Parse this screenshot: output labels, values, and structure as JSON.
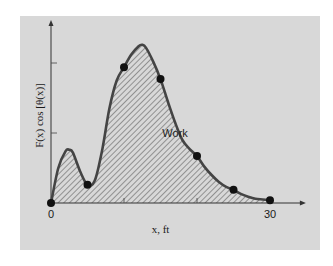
{
  "chart_data": {
    "type": "area",
    "title": "",
    "xlabel": "x, ft",
    "ylabel": "F(x) cos [θ(x)]",
    "xlim": [
      0,
      33
    ],
    "ylim": [
      0,
      2.6
    ],
    "x_ticks": [
      0,
      10,
      20,
      30
    ],
    "x_tick_labels": [
      "0",
      "",
      "",
      "30"
    ],
    "y_ticks": [
      1,
      2
    ],
    "y_tick_labels": [
      "",
      ""
    ],
    "grid": false,
    "area_label": "Work",
    "points": {
      "x": [
        0,
        5,
        10,
        15,
        20,
        25,
        30
      ],
      "y": [
        0.0,
        0.26,
        1.94,
        1.77,
        0.67,
        0.19,
        0.04
      ]
    },
    "curve": {
      "x": [
        0,
        1,
        2,
        2.5,
        3,
        4,
        5,
        6,
        7,
        8,
        9,
        10,
        11,
        12,
        12.5,
        13,
        14,
        15,
        16,
        17,
        18,
        19,
        20,
        21,
        22,
        23,
        24,
        25,
        26,
        27,
        28,
        29,
        30
      ],
      "y": [
        0.0,
        0.5,
        0.74,
        0.76,
        0.72,
        0.45,
        0.26,
        0.32,
        0.75,
        1.35,
        1.75,
        1.94,
        2.12,
        2.24,
        2.26,
        2.22,
        2.02,
        1.77,
        1.45,
        1.15,
        0.9,
        0.77,
        0.67,
        0.52,
        0.4,
        0.3,
        0.23,
        0.19,
        0.13,
        0.09,
        0.06,
        0.05,
        0.04
      ]
    }
  }
}
